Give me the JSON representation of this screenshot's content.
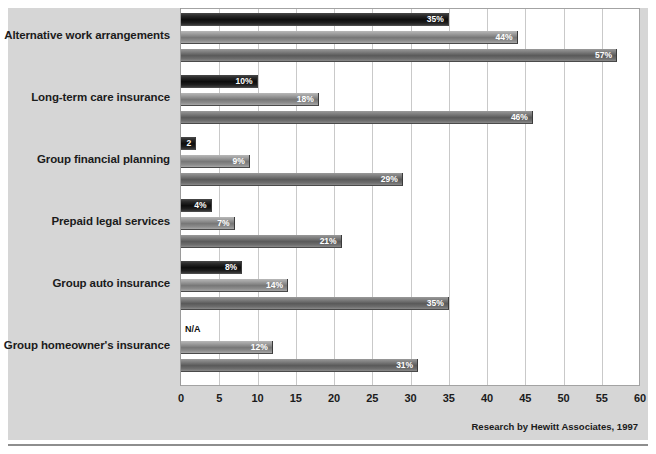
{
  "chart_data": {
    "type": "bar",
    "orientation": "horizontal",
    "title": "",
    "xlabel": "",
    "ylabel": "",
    "xlim": [
      0,
      60
    ],
    "xticks": [
      0,
      5,
      10,
      15,
      20,
      25,
      30,
      35,
      40,
      45,
      50,
      55,
      60
    ],
    "grid": true,
    "legend_position": "bottom-left",
    "categories": [
      "Alternative work arrangements",
      "Long-term care insurance",
      "Group financial planning",
      "Prepaid legal services",
      "Group auto insurance",
      "Group homeowner's insurance"
    ],
    "series": [
      {
        "name": "1994",
        "color": "#111111",
        "values": [
          35,
          10,
          2,
          4,
          8,
          null
        ],
        "labels": [
          "35%",
          "10%",
          "2",
          "4%",
          "8%",
          "N/A"
        ]
      },
      {
        "name": "1997",
        "color": "#8d8d8d",
        "values": [
          44,
          18,
          9,
          7,
          14,
          12
        ],
        "labels": [
          "44%",
          "18%",
          "9%",
          "7%",
          "14%",
          "12%"
        ]
      },
      {
        "name": "2000",
        "color": "#6b6b6b",
        "values": [
          57,
          46,
          29,
          21,
          35,
          31
        ],
        "labels": [
          "57%",
          "46%",
          "29%",
          "21%",
          "35%",
          "31%"
        ]
      }
    ]
  },
  "legend": {
    "entries": [
      {
        "label": "1994"
      },
      {
        "label": "1997"
      },
      {
        "label": "2000"
      }
    ],
    "projected_note": "(projected)"
  },
  "footer": {
    "attribution": "Research by Hewitt Associates, 1997"
  }
}
